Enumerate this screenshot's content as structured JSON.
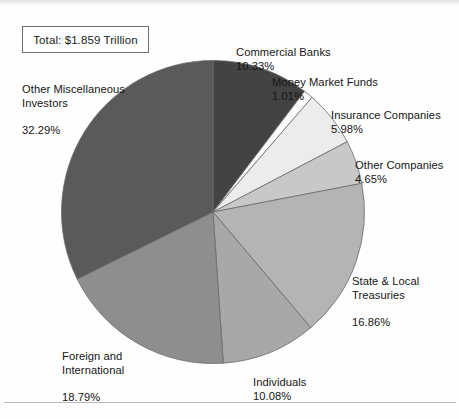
{
  "figure": {
    "total_label": "Total:  $1.859 Trillion",
    "background": "#fefefe"
  },
  "chart_data": {
    "type": "pie",
    "title": "",
    "subtitle": "",
    "xlabel": "",
    "ylabel": "",
    "total_annotation": "Total:  $1.859 Trillion",
    "units": "percent of total",
    "start_angle_deg": 0,
    "direction": "clockwise",
    "legend_position": "none (direct callout labels)",
    "grid": false,
    "categories": [
      "Commercial Banks",
      "Money Market Funds",
      "Insurance Companies",
      "Other Companies",
      "State & Local Treasuries",
      "Individuals",
      "Foreign and International",
      "Other Miscellaneous Investors"
    ],
    "values": [
      10.33,
      1.01,
      5.98,
      4.65,
      16.86,
      10.08,
      18.79,
      32.29
    ],
    "value_labels": [
      "10.33%",
      "1.01%",
      "5.98%",
      "4.65%",
      "16.86%",
      "10.08%",
      "18.79%",
      "32.29%"
    ],
    "colors": [
      "#434343",
      "#fafafa",
      "#ececec",
      "#c8c8c8",
      "#b4b4b4",
      "#a8a8a8",
      "#8e8e8e",
      "#5a5a5a"
    ],
    "slices": [
      {
        "label": "Commercial Banks",
        "name_line1": "Commercial Banks",
        "name_line2": "",
        "pct": "10.33%",
        "value": 10.33,
        "color": "#434343"
      },
      {
        "label": "Money Market Funds",
        "name_line1": "Money Market Funds",
        "name_line2": "",
        "pct": "1.01%",
        "value": 1.01,
        "color": "#fafafa"
      },
      {
        "label": "Insurance Companies",
        "name_line1": "Insurance Companies",
        "name_line2": "",
        "pct": "5.98%",
        "value": 5.98,
        "color": "#ececec"
      },
      {
        "label": "Other Companies",
        "name_line1": "Other Companies",
        "name_line2": "",
        "pct": "4.65%",
        "value": 4.65,
        "color": "#c8c8c8"
      },
      {
        "label": "State & Local Treasuries",
        "name_line1": "State & Local",
        "name_line2": "Treasuries",
        "pct": "16.86%",
        "value": 16.86,
        "color": "#b4b4b4"
      },
      {
        "label": "Individuals",
        "name_line1": "Individuals",
        "name_line2": "",
        "pct": "10.08%",
        "value": 10.08,
        "color": "#a8a8a8"
      },
      {
        "label": "Foreign and International",
        "name_line1": "Foreign and",
        "name_line2": "International",
        "pct": "18.79%",
        "value": 18.79,
        "color": "#8e8e8e"
      },
      {
        "label": "Other Miscellaneous Investors",
        "name_line1": "Other Miscellaneous",
        "name_line2": "Investors",
        "pct": "32.29%",
        "value": 32.29,
        "color": "#5a5a5a"
      }
    ]
  }
}
